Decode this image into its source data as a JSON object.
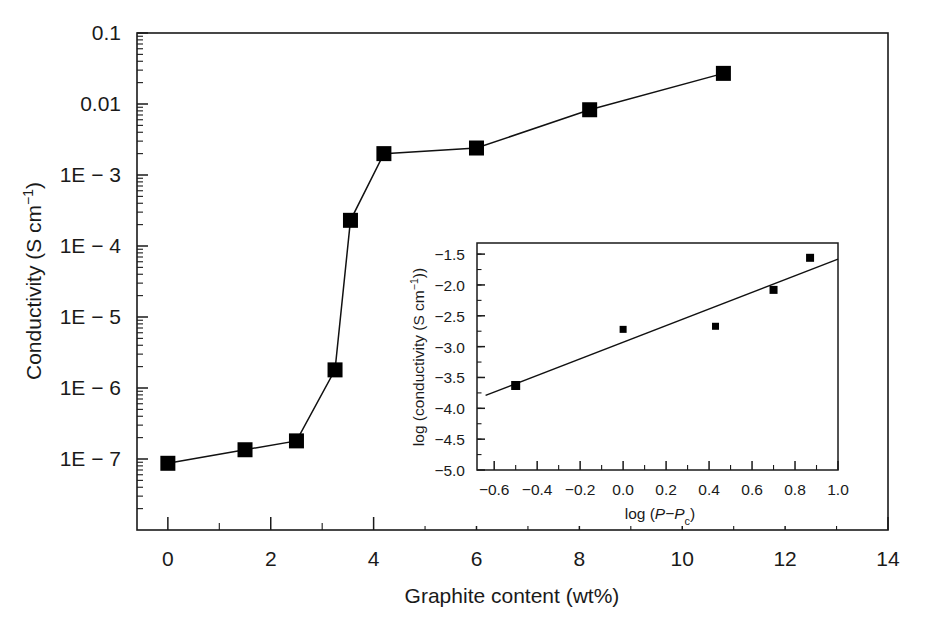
{
  "figure": {
    "background_color": "#ffffff",
    "ink_color": "#1a1a1a",
    "marker_color": "#000000",
    "width": 927,
    "height": 627
  },
  "chart_data": {
    "type": "line",
    "title": "",
    "xlabel": "Graphite content (wt%)",
    "ylabel": "Conductivity (S cm⁻¹)",
    "xlim": [
      -0.6,
      14
    ],
    "ylim": [
      1e-08,
      0.1
    ],
    "yscale": "log",
    "xscale": "linear",
    "grid": false,
    "legend": "none",
    "x_tick_labels": [
      "0",
      "2",
      "4",
      "6",
      "8",
      "10",
      "12",
      "14"
    ],
    "x_tick_values": [
      0,
      2,
      4,
      6,
      8,
      10,
      12,
      14
    ],
    "x_minor_tick_values": [
      1,
      3,
      5,
      7,
      9,
      11,
      13
    ],
    "y_tick_labels": [
      "0.1",
      "0.01",
      "1E − 3",
      "1E − 4",
      "1E − 5",
      "1E − 6",
      "1E − 7"
    ],
    "y_tick_values": [
      0.1,
      0.01,
      0.001,
      0.0001,
      1e-05,
      1e-06,
      1e-07
    ],
    "series": [
      {
        "name": "Conductivity vs graphite content",
        "marker": "filled-square",
        "x": [
          0.0,
          1.5,
          2.5,
          3.25,
          3.55,
          4.2,
          6.0,
          8.2,
          10.8
        ],
        "y": [
          8.7e-08,
          1.35e-07,
          1.8e-07,
          1.8e-06,
          0.00023,
          0.002,
          0.0024,
          0.0083,
          0.027
        ]
      }
    ]
  },
  "inset_chart_data": {
    "type": "scatter",
    "title": "",
    "xlabel": "log (P−Pc)",
    "xlabel_parts": {
      "prefix": "log (",
      "italic1": "P",
      "dash": "−",
      "italic2": "P",
      "subscript": "c",
      "suffix": ")"
    },
    "ylabel": "log (conductivity (S cm⁻¹))",
    "xlim": [
      -0.68,
      1.0
    ],
    "ylim": [
      -5.0,
      -1.32
    ],
    "grid": false,
    "legend": "none",
    "x_tick_labels": [
      "−0.6",
      "−0.4",
      "−0.2",
      "0.0",
      "0.2",
      "0.4",
      "0.6",
      "0.8",
      "1.0"
    ],
    "x_tick_values": [
      -0.6,
      -0.4,
      -0.2,
      0.0,
      0.2,
      0.4,
      0.6,
      0.8,
      1.0
    ],
    "y_tick_labels": [
      "−1.5",
      "−2.0",
      "−2.5",
      "−3.0",
      "−3.5",
      "−4.0",
      "−4.5",
      "−5.0"
    ],
    "y_tick_values": [
      -1.5,
      -2.0,
      -2.5,
      -3.0,
      -3.5,
      -4.0,
      -4.5,
      -5.0
    ],
    "points": {
      "x": [
        -0.5,
        0.0,
        0.43,
        0.7,
        0.87
      ],
      "y": [
        -3.63,
        -2.72,
        -2.67,
        -2.08,
        -1.56
      ],
      "marker": "filled-square"
    },
    "fit_line": {
      "x": [
        -0.64,
        1.0
      ],
      "y": [
        -3.79,
        -1.58
      ],
      "slope": 1.35,
      "intercept": -2.93
    }
  }
}
